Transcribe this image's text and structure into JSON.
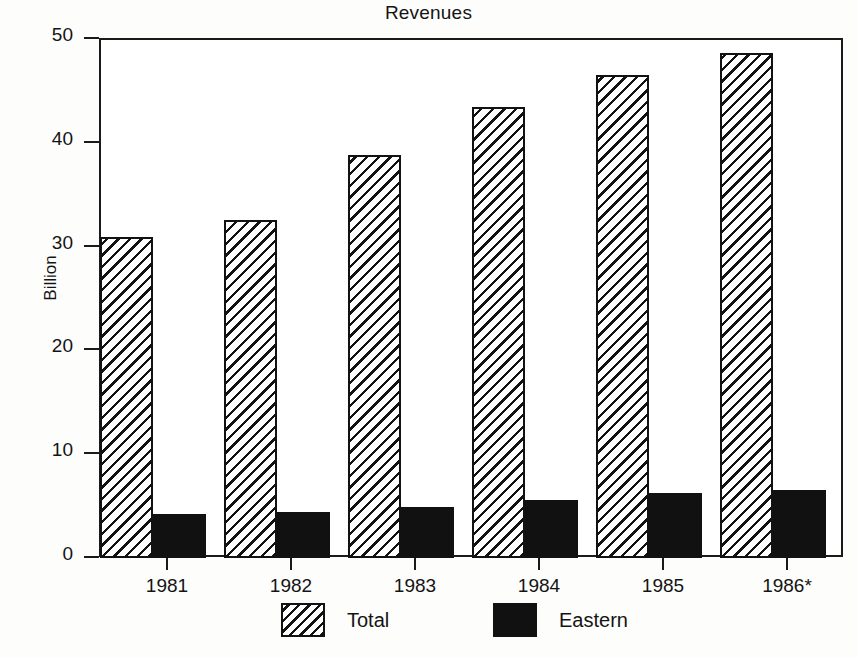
{
  "chart_data": {
    "type": "bar",
    "title": "Revenues",
    "xlabel": "",
    "ylabel": "Billion",
    "categories": [
      "1981",
      "1982",
      "1983",
      "1984",
      "1985",
      "1986*"
    ],
    "series": [
      {
        "name": "Total",
        "values": [
          30.8,
          32.5,
          38.7,
          43.4,
          46.4,
          48.6
        ]
      },
      {
        "name": "Eastern",
        "values": [
          4.1,
          4.3,
          4.8,
          5.5,
          6.2,
          6.5
        ]
      }
    ],
    "ylim": [
      0,
      50
    ],
    "yticks": [
      0,
      10,
      20,
      30,
      40,
      50
    ],
    "ytick_labels": [
      "0",
      "10",
      "20",
      "30",
      "40",
      "50"
    ],
    "grid": false,
    "legend_position": "bottom",
    "legend": [
      "Total",
      "Eastern"
    ],
    "footnote": "*"
  },
  "colors": {
    "axis": "#1a1a1a",
    "text": "#141414",
    "total_fill": "#ffffff",
    "total_hatch": "#121212",
    "eastern_fill": "#111111",
    "background": "#ffffff"
  }
}
